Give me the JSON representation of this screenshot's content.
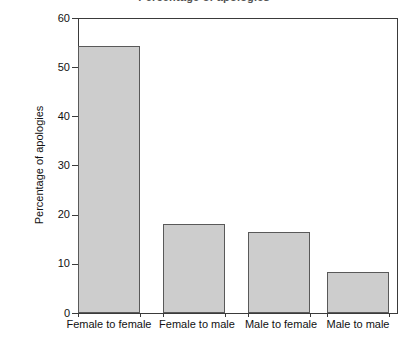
{
  "chart_data": {
    "type": "bar",
    "title": "",
    "xlabel": "",
    "ylabel": "Percentage of apologies",
    "categories": [
      "Female to female",
      "Female to male",
      "Male to female",
      "Male to male"
    ],
    "values": [
      54.3,
      18.1,
      16.5,
      8.3
    ],
    "ylim": [
      0,
      60
    ],
    "yticks": [
      0,
      10,
      20,
      30,
      40,
      50,
      60
    ],
    "ytick_labels": [
      "0",
      "10",
      "20",
      "30",
      "40",
      "50",
      "60"
    ],
    "grid": false,
    "legend": false,
    "bar_fill_color": "#cdcdcd",
    "bar_edge_color": "#595959",
    "axis_color": "#3a3a3a",
    "background_color": "#ffffff"
  },
  "axes": {
    "y_title": "Percentage of apologies",
    "tick_0": "0",
    "tick_1": "10",
    "tick_2": "20",
    "tick_3": "30",
    "tick_4": "40",
    "tick_5": "50",
    "tick_6": "60"
  },
  "categories": {
    "c0": "Female to female",
    "c1": "Female to male",
    "c2": "Male to female",
    "c3": "Male to male"
  },
  "title_crop": "Percentage of apologies"
}
